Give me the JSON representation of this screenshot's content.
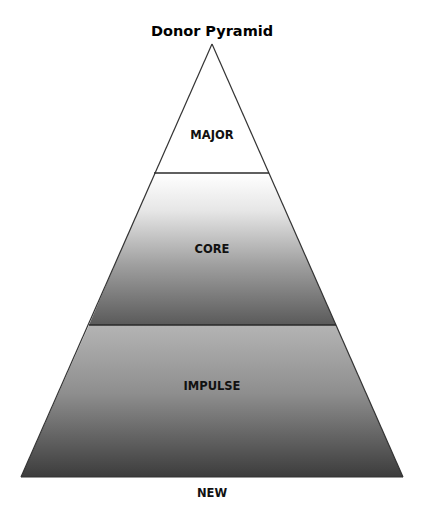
{
  "diagram": {
    "type": "pyramid",
    "title": "Donor Pyramid",
    "tiers": [
      {
        "label": "MAJOR",
        "position": "top",
        "fill": "solid",
        "color": "#ffffff"
      },
      {
        "label": "CORE",
        "position": "middle",
        "fill": "vertical-gradient",
        "gradient_top": "#ffffff",
        "gradient_bottom": "#5a5a5a"
      },
      {
        "label": "IMPULSE",
        "position": "bottom",
        "fill": "vertical-gradient",
        "gradient_top": "#b4b4b4",
        "gradient_bottom": "#3c3c3c"
      }
    ],
    "base_label": "NEW",
    "outline_color": "#333333",
    "divider_color": "#2a2a2a"
  }
}
